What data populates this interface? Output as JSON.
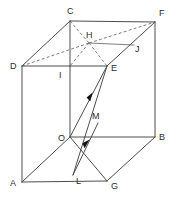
{
  "figure": {
    "type": "geometry-diagram",
    "canvas": {
      "width": 170,
      "height": 199
    },
    "colors": {
      "background": "#ffffff",
      "solid_edge": "#4d4d4d",
      "hidden_edge": "#6e6e6e",
      "thin_edge": "#707070",
      "arrow": "#111111",
      "label": "#2b2b2b"
    }
  },
  "points": {
    "A": {
      "label": "A",
      "x": 22,
      "y": 182,
      "lx": 11,
      "ly": 185
    },
    "B": {
      "label": "B",
      "x": 155,
      "y": 137,
      "lx": 159,
      "ly": 139
    },
    "C": {
      "label": "C",
      "x": 70,
      "y": 21,
      "lx": 67,
      "ly": 14
    },
    "D": {
      "label": "D",
      "x": 22,
      "y": 66,
      "lx": 11,
      "ly": 69
    },
    "E": {
      "label": "E",
      "x": 107,
      "y": 66,
      "lx": 111,
      "ly": 70
    },
    "F": {
      "label": "F",
      "x": 155,
      "y": 22,
      "lx": 159,
      "ly": 16
    },
    "G": {
      "label": "G",
      "x": 107,
      "y": 181,
      "lx": 111,
      "ly": 188
    },
    "H": {
      "label": "H",
      "x": 89,
      "y": 43,
      "lx": 86,
      "ly": 38
    },
    "I": {
      "label": "I",
      "x": 70,
      "y": 66,
      "lx": 58,
      "ly": 76
    },
    "J": {
      "label": "J",
      "x": 134,
      "y": 45,
      "lx": 135,
      "ly": 52
    },
    "M": {
      "label": "M",
      "x": 98,
      "y": 123,
      "lx": 94,
      "ly": 118
    },
    "L": {
      "label": "L",
      "x": 73,
      "y": 175,
      "lx": 76,
      "ly": 182
    },
    "O": {
      "label": "O",
      "x": 70,
      "y": 137,
      "lx": 60,
      "ly": 140
    }
  },
  "vertex_labels": [
    {
      "name": "label-C",
      "text": "C",
      "x": 67,
      "y": 14
    },
    {
      "name": "label-F",
      "text": "F",
      "x": 159,
      "y": 16
    },
    {
      "name": "label-H",
      "text": "H",
      "x": 86,
      "y": 38
    },
    {
      "name": "label-J",
      "text": "J",
      "x": 135,
      "y": 52
    },
    {
      "name": "label-D",
      "text": "D",
      "x": 11,
      "y": 69
    },
    {
      "name": "label-I",
      "text": "I",
      "x": 58,
      "y": 77
    },
    {
      "name": "label-E",
      "text": "E",
      "x": 111,
      "y": 70
    },
    {
      "name": "label-M",
      "text": "M",
      "x": 93,
      "y": 119
    },
    {
      "name": "label-O",
      "text": "O",
      "x": 59,
      "y": 141
    },
    {
      "name": "label-B",
      "text": "B",
      "x": 159,
      "y": 140
    },
    {
      "name": "label-L",
      "text": "L",
      "x": 76,
      "y": 183
    },
    {
      "name": "label-A",
      "text": "A",
      "x": 11,
      "y": 185
    },
    {
      "name": "label-G",
      "text": "G",
      "x": 111,
      "y": 188
    }
  ],
  "edges": {
    "solid": [
      {
        "name": "edge-C-F",
        "from": "C",
        "to": "F"
      },
      {
        "name": "edge-C-D",
        "from": "C",
        "to": "D"
      },
      {
        "name": "edge-F-B",
        "from": "F",
        "to": "B"
      },
      {
        "name": "edge-D-A",
        "from": "D",
        "to": "A"
      },
      {
        "name": "edge-A-G",
        "from": "A",
        "to": "G"
      },
      {
        "name": "edge-G-B",
        "from": "G",
        "to": "B"
      },
      {
        "name": "edge-A-O",
        "from": "A",
        "to": "O"
      },
      {
        "name": "edge-O-E",
        "from": "O",
        "to": "E"
      },
      {
        "name": "edge-E-F",
        "from": "E",
        "to": "F"
      },
      {
        "name": "edge-D-E",
        "from": "D",
        "to": "E"
      },
      {
        "name": "edge-O-B",
        "from": "O",
        "to": "B"
      },
      {
        "name": "edge-O-G",
        "from": "O",
        "to": "G"
      },
      {
        "name": "edge-I-O",
        "from": "I",
        "to": "O"
      },
      {
        "name": "edge-C-I",
        "from": "C",
        "to": "I"
      }
    ],
    "thin": [
      {
        "name": "edge-H-J",
        "from": "H",
        "to": "J"
      }
    ],
    "dashed": [
      {
        "name": "edge-D-H",
        "from": "D",
        "to": "H"
      },
      {
        "name": "edge-H-F",
        "from": "H",
        "to": "F"
      },
      {
        "name": "edge-C-H",
        "from": "C",
        "to": "H"
      },
      {
        "name": "edge-H-E",
        "from": "H",
        "to": "E"
      },
      {
        "name": "edge-H-I",
        "from": "H",
        "to": "I"
      }
    ]
  },
  "rays": [
    {
      "name": "ray-L-to-E",
      "description": "directed segment from L toward E with arrowhead",
      "from": "L",
      "to": "E",
      "arrow_at": {
        "x": 92,
        "y": 97
      }
    },
    {
      "name": "ray-L-to-M",
      "description": "directed segment from L toward M with arrowhead",
      "from": "L",
      "to": "M",
      "arrow_at": {
        "x": 88,
        "y": 144
      }
    }
  ]
}
